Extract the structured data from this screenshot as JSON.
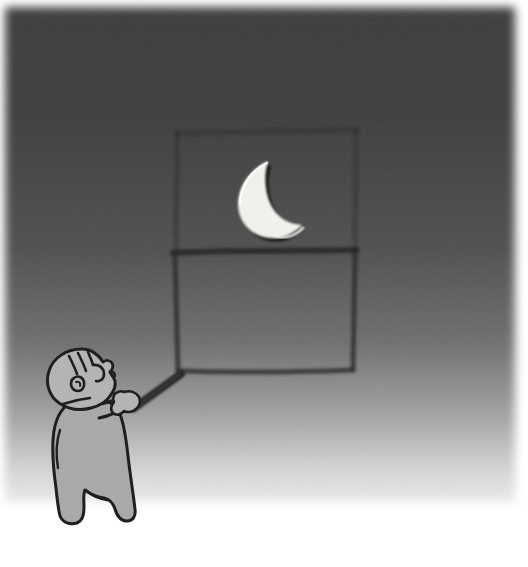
{
  "scene": {
    "title": "Child Pointing a Stick at a Crescent Moon in a Window",
    "alt_text": "A small child in a gray robe stands at the lower left of a dark room, holding a long stick that reaches up to the bottom edge of a window frame. A white crescent moon shines in the upper pane of the window.",
    "width": 528,
    "height": 567
  },
  "canvas": {
    "margin_left": 5,
    "margin_right": 5,
    "margin_top": 7,
    "margin_bottom": 62,
    "paper_color": "#ffffff"
  },
  "background": {
    "name": "night-room-wall",
    "type": "vertical-gradient",
    "stops": [
      {
        "offset": "0%",
        "color": "#3b3b3b"
      },
      {
        "offset": "22%",
        "color": "#3d3d3d"
      },
      {
        "offset": "48%",
        "color": "#4f4f4f"
      },
      {
        "offset": "66%",
        "color": "#6f6f6f"
      },
      {
        "offset": "80%",
        "color": "#a3a3a3"
      },
      {
        "offset": "90%",
        "color": "#d4d4d4"
      },
      {
        "offset": "100%",
        "color": "#f7f7f7"
      }
    ],
    "edge_feather_px": 14,
    "texture": "grainy paper noise"
  },
  "window": {
    "name": "window-frame",
    "frame_color": "#2f2f2f",
    "upper_pane_stroke_opacity": 0.35,
    "lower_pane_stroke_opacity": 0.85,
    "outer": {
      "x": 176,
      "y": 130,
      "width": 180,
      "height": 240
    },
    "mullion_y": 252,
    "stroke_width": 5,
    "panes": [
      {
        "label": "upper pane",
        "contains": "crescent moon"
      },
      {
        "label": "lower pane",
        "contains": "empty"
      }
    ]
  },
  "moon": {
    "name": "crescent-moon",
    "fill": "#f2f2ee",
    "outline": "#262626",
    "highlight": "#ffffff",
    "center_x": 268,
    "center_y": 196,
    "radius": 32,
    "phase": "waxing crescent"
  },
  "child": {
    "name": "child-figure",
    "skin_fill": "#b4b4b4",
    "robe_fill": "#a8a8a8",
    "outline": "#1f1f1f",
    "outline_width": 3,
    "facing": "right",
    "head": {
      "cx": 82,
      "cy": 378,
      "rx": 34,
      "ry": 30
    },
    "parts": [
      "head",
      "hair-strands",
      "eye",
      "ear",
      "nose",
      "robe-body",
      "arm",
      "hand",
      "left-foot",
      "right-foot"
    ]
  },
  "stick": {
    "name": "pointing-stick",
    "color": "#2c2c2c",
    "from": {
      "x": 133,
      "y": 406
    },
    "to": {
      "x": 180,
      "y": 372
    },
    "width_near_hand": 7,
    "width_near_window": 5,
    "meets": "bottom-left corner of the window frame"
  }
}
